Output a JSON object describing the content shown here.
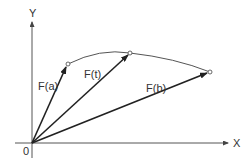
{
  "diagram": {
    "axes": {
      "x_label": "X",
      "y_label": "Y",
      "origin_label": "0"
    },
    "vectors": [
      {
        "label": "F(a)",
        "tip": [
          68,
          64
        ]
      },
      {
        "label": "F(t)",
        "tip": [
          130,
          53
        ]
      },
      {
        "label": "F(b)",
        "tip": [
          210,
          72
        ]
      }
    ],
    "curve": "path from F(a) through F(t) to F(b)",
    "colors": {
      "stroke": "#222222",
      "axis": "#555555",
      "text": "#333333"
    }
  }
}
